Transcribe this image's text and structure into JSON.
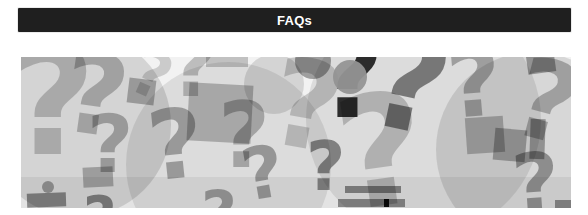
{
  "page": {
    "background": "#ffffff"
  },
  "header": {
    "label": "FAQs",
    "background": "#1f1f1f",
    "text_color": "#ffffff"
  },
  "collage": {
    "name": "question-marks-collage",
    "description": "Collage of overlapping gray question marks",
    "background": "#f2f2f2",
    "glyph": "?",
    "items": [
      {
        "type": "circle",
        "x": -35,
        "y": -25,
        "w": 185,
        "h": 185,
        "color": "rgba(0,0,0,0.12)"
      },
      {
        "type": "circle",
        "x": 105,
        "y": 5,
        "w": 205,
        "h": 205,
        "color": "rgba(0,0,0,0.09)"
      },
      {
        "type": "circle",
        "x": 285,
        "y": -55,
        "w": 235,
        "h": 235,
        "color": "rgba(0,0,0,0.09)"
      },
      {
        "type": "circle",
        "x": 415,
        "y": -5,
        "w": 195,
        "h": 195,
        "color": "rgba(0,0,0,0.11)"
      },
      {
        "type": "bar",
        "x": 0,
        "y": 120,
        "w": 550,
        "h": 31,
        "color": "rgba(0,0,0,0.06)"
      },
      {
        "type": "qmark",
        "x": -12,
        "y": -30,
        "size": 150,
        "rot": 0,
        "color": "rgba(0,0,0,0.20)"
      },
      {
        "type": "qmark",
        "x": 42,
        "y": -18,
        "size": 112,
        "rot": 8,
        "color": "rgba(0,0,0,0.24)"
      },
      {
        "type": "qmark",
        "x": 66,
        "y": 48,
        "size": 80,
        "rot": 0,
        "color": "rgba(0,0,0,0.28)"
      },
      {
        "type": "qmark",
        "x": 112,
        "y": -14,
        "size": 64,
        "rot": 24,
        "color": "rgba(0,0,0,0.16)"
      },
      {
        "type": "square",
        "x": 107,
        "y": 22,
        "w": 27,
        "h": 25,
        "rot": 7,
        "color": "rgba(0,0,0,0.28)"
      },
      {
        "type": "qmark",
        "x": 127,
        "y": 40,
        "size": 96,
        "rot": -6,
        "color": "rgba(0,0,0,0.30)"
      },
      {
        "type": "qmark",
        "x": 148,
        "y": -32,
        "size": 84,
        "rot": 0,
        "color": "rgba(0,0,0,0.22)"
      },
      {
        "type": "square",
        "x": 62,
        "y": 110,
        "w": 30,
        "h": 20,
        "rot": -3,
        "color": "rgba(0,0,0,0.26)"
      },
      {
        "type": "dot",
        "x": 21,
        "y": 124,
        "w": 12,
        "h": 12,
        "color": "rgba(0,0,0,0.32)"
      },
      {
        "type": "square",
        "x": 6,
        "y": 136,
        "w": 39,
        "h": 14,
        "rot": -2,
        "color": "rgba(0,0,0,0.40)"
      },
      {
        "type": "square",
        "x": 167,
        "y": 27,
        "w": 64,
        "h": 58,
        "rot": 3,
        "color": "rgba(0,0,0,0.24)"
      },
      {
        "type": "square",
        "x": 185,
        "y": -7,
        "w": 42,
        "h": 17,
        "rot": 0,
        "color": "rgba(0,0,0,0.20)"
      },
      {
        "type": "circle",
        "x": 223,
        "y": -3,
        "w": 60,
        "h": 60,
        "color": "rgba(0,0,0,0.12)"
      },
      {
        "type": "qmark",
        "x": 197,
        "y": 34,
        "size": 90,
        "rot": 0,
        "color": "rgba(0,0,0,0.26)"
      },
      {
        "type": "qmark",
        "x": 221,
        "y": 80,
        "size": 72,
        "rot": -10,
        "color": "rgba(0,0,0,0.32)"
      },
      {
        "type": "qmark",
        "x": 250,
        "y": -12,
        "size": 122,
        "rot": 10,
        "color": "rgba(0,0,0,0.18)"
      },
      {
        "type": "circle",
        "x": 274,
        "y": -14,
        "w": 36,
        "h": 36,
        "color": "rgba(0,0,0,0.34)"
      },
      {
        "type": "qmark",
        "x": 285,
        "y": 76,
        "size": 68,
        "rot": 0,
        "color": "rgba(0,0,0,0.42)"
      },
      {
        "type": "qmark",
        "x": 297,
        "y": -36,
        "size": 114,
        "rot": 0,
        "color": "rgba(0,0,0,0.80)"
      },
      {
        "type": "dot",
        "x": 312,
        "y": 3,
        "w": 34,
        "h": 34,
        "color": "rgba(148,148,148,0.95)"
      },
      {
        "type": "qmark",
        "x": 350,
        "y": -40,
        "size": 134,
        "rot": 12,
        "color": "rgba(0,0,0,0.46)"
      },
      {
        "type": "qmark",
        "x": 316,
        "y": 18,
        "size": 154,
        "rot": -8,
        "color": "rgba(0,0,0,0.20)"
      },
      {
        "type": "qmark",
        "x": 426,
        "y": -20,
        "size": 94,
        "rot": -5,
        "color": "rgba(0,0,0,0.28)"
      },
      {
        "type": "square",
        "x": 445,
        "y": 60,
        "w": 38,
        "h": 36,
        "rot": -4,
        "color": "rgba(0,0,0,0.24)"
      },
      {
        "type": "square",
        "x": 473,
        "y": 72,
        "w": 32,
        "h": 32,
        "rot": 5,
        "color": "rgba(0,0,0,0.28)"
      },
      {
        "type": "square",
        "x": 506,
        "y": -4,
        "w": 28,
        "h": 20,
        "rot": -8,
        "color": "rgba(0,0,0,0.32)"
      },
      {
        "type": "qmark",
        "x": 494,
        "y": -10,
        "size": 110,
        "rot": 15,
        "color": "rgba(0,0,0,0.26)"
      },
      {
        "type": "square",
        "x": 509,
        "y": 62,
        "w": 15,
        "h": 40,
        "rot": 2,
        "color": "rgba(0,0,0,0.32)"
      },
      {
        "type": "qmark",
        "x": 491,
        "y": 86,
        "size": 82,
        "rot": -4,
        "color": "rgba(0,0,0,0.34)"
      },
      {
        "type": "qmark",
        "x": 62,
        "y": 132,
        "size": 58,
        "rot": 0,
        "color": "rgba(0,0,0,0.42)"
      },
      {
        "type": "qmark",
        "x": 180,
        "y": 126,
        "size": 62,
        "rot": 0,
        "color": "rgba(0,0,0,0.32)"
      },
      {
        "type": "bar",
        "x": 324,
        "y": 129,
        "w": 56,
        "h": 7,
        "rot": 0,
        "color": "rgba(0,0,0,0.42)"
      },
      {
        "type": "bar",
        "x": 317,
        "y": 142,
        "w": 67,
        "h": 8,
        "rot": 0,
        "color": "rgba(0,0,0,0.40)"
      },
      {
        "type": "bar",
        "x": 363,
        "y": 142,
        "w": 5,
        "h": 8,
        "rot": 0,
        "color": "rgba(0,0,0,0.92)"
      },
      {
        "type": "square",
        "x": 534,
        "y": 143,
        "w": 30,
        "h": 8,
        "rot": 0,
        "color": "rgba(0,0,0,0.38)"
      }
    ]
  }
}
